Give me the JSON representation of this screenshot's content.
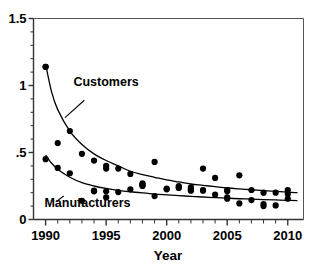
{
  "chart_data": {
    "type": "scatter",
    "title": "",
    "xlabel": "Year",
    "ylabel": "",
    "xlim": [
      1989.0,
      2011.3
    ],
    "ylim": [
      0,
      1.5
    ],
    "xticks": [
      1990,
      1995,
      2000,
      2005,
      2010
    ],
    "xtick_labels": [
      "1990",
      "1995",
      "2000",
      "2005",
      "2010"
    ],
    "yticks": [
      0,
      0.5,
      1,
      1.5
    ],
    "ytick_labels": [
      "0",
      ".5",
      "1",
      "1.5"
    ],
    "x_minor_tick_step": 1,
    "y_minor_tick_step": 0.1,
    "grid": false,
    "legend_position": "inline-annotation",
    "marker": "filled-circle",
    "marker_color": "#000000",
    "fit_line_color": "#000000",
    "series": [
      {
        "name": "Customers",
        "annotation_label": "Customers",
        "x": [
          1990,
          1990,
          1991,
          1992,
          1993,
          1994,
          1995,
          1995,
          1996,
          1997,
          1998,
          1998,
          1999,
          2000,
          2001,
          2001,
          2002,
          2002,
          2003,
          2003,
          2004,
          2005,
          2005,
          2006,
          2007,
          2008,
          2009,
          2010,
          2010
        ],
        "values": [
          1.14,
          1.14,
          0.57,
          0.66,
          0.49,
          0.44,
          0.4,
          0.38,
          0.38,
          0.34,
          0.27,
          0.26,
          0.43,
          0.23,
          0.25,
          0.24,
          0.24,
          0.22,
          0.38,
          0.22,
          0.31,
          0.22,
          0.21,
          0.33,
          0.22,
          0.2,
          0.2,
          0.22,
          0.19
        ],
        "fit_curve": {
          "type": "power",
          "x": [
            1990.0,
            1990.5,
            1991,
            1992,
            1993,
            1994,
            1995,
            1996,
            1997,
            1998,
            1999,
            2000,
            2001,
            2002,
            2003,
            2004,
            2005,
            2006,
            2007,
            2008,
            2009,
            2010,
            2010.8
          ],
          "y": [
            1.16,
            0.95,
            0.82,
            0.66,
            0.56,
            0.49,
            0.44,
            0.4,
            0.36,
            0.335,
            0.315,
            0.295,
            0.28,
            0.265,
            0.255,
            0.245,
            0.235,
            0.228,
            0.222,
            0.215,
            0.21,
            0.205,
            0.2
          ]
        }
      },
      {
        "name": "Manufacturers",
        "annotation_label": "Manufacturers",
        "x": [
          1990,
          1991,
          1992,
          1993,
          1994,
          1994,
          1995,
          1995,
          1996,
          1997,
          1998,
          1998,
          1999,
          2000,
          2001,
          2002,
          2002,
          2003,
          2004,
          2005,
          2005,
          2006,
          2007,
          2008,
          2008,
          2009,
          2010
        ],
        "values": [
          0.45,
          0.385,
          0.345,
          0.14,
          0.215,
          0.21,
          0.21,
          0.165,
          0.205,
          0.225,
          0.255,
          0.25,
          0.175,
          0.225,
          0.235,
          0.225,
          0.215,
          0.215,
          0.185,
          0.165,
          0.155,
          0.12,
          0.145,
          0.1,
          0.115,
          0.105,
          0.155
        ],
        "fit_curve": {
          "type": "power",
          "x": [
            1990.0,
            1990.5,
            1991,
            1992,
            1993,
            1994,
            1995,
            1996,
            1997,
            1998,
            1999,
            2000,
            2001,
            2002,
            2003,
            2004,
            2005,
            2006,
            2007,
            2008,
            2009,
            2010,
            2010.8
          ],
          "y": [
            0.48,
            0.42,
            0.375,
            0.315,
            0.275,
            0.25,
            0.232,
            0.218,
            0.207,
            0.198,
            0.19,
            0.184,
            0.178,
            0.173,
            0.168,
            0.163,
            0.159,
            0.155,
            0.152,
            0.149,
            0.146,
            0.143,
            0.141
          ]
        }
      }
    ],
    "annotations": [
      {
        "text": "Customers",
        "text_x": 1992.3,
        "text_y": 1.0,
        "leader_from": [
          1993.2,
          0.89
        ],
        "leader_to": [
          1991.6,
          0.76
        ]
      },
      {
        "text": "Manufacturers",
        "text_x": 1989.9,
        "text_y": 0.095,
        "leader_from": [
          1991.5,
          0.175
        ],
        "leader_to": [
          1990.9,
          0.135
        ]
      }
    ]
  },
  "clipped_header_text": ""
}
